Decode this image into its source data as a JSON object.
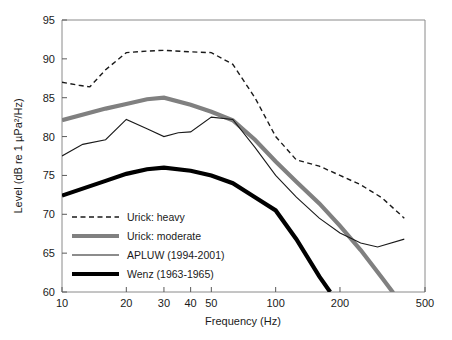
{
  "chart_data": {
    "type": "line",
    "title": "",
    "xlabel": "Frequency (Hz)",
    "ylabel": "Level (dB re 1 µPa²/Hz)",
    "xscale": "log",
    "xlim": [
      10,
      500
    ],
    "ylim": [
      60,
      95
    ],
    "grid": false,
    "legend_position": "lower left (inside axes)",
    "xticks": [
      10,
      20,
      30,
      40,
      50,
      100,
      200,
      500
    ],
    "xticklabels": [
      "10",
      "20",
      "30",
      "40",
      "50",
      "100",
      "200",
      "500"
    ],
    "yticks": [
      60,
      65,
      70,
      75,
      80,
      85,
      90,
      95
    ],
    "yticklabels": [
      "60",
      "65",
      "70",
      "75",
      "80",
      "85",
      "90",
      "95"
    ],
    "series": [
      {
        "name": "Urick: heavy",
        "style": "dashed",
        "color": "#1a1a1a",
        "width": 1.4,
        "x": [
          10,
          12,
          13.5,
          16,
          20,
          25,
          30,
          40,
          50,
          63,
          80,
          100,
          125,
          160,
          200,
          250,
          315,
          400
        ],
        "y": [
          87.0,
          86.6,
          86.4,
          88.6,
          90.8,
          91.0,
          91.1,
          90.9,
          90.8,
          89.3,
          85.0,
          80.0,
          77.0,
          76.2,
          75.0,
          73.8,
          72.1,
          69.5
        ]
      },
      {
        "name": "Urick: moderate",
        "style": "solid",
        "color": "#808080",
        "width": 4.2,
        "x": [
          10,
          16,
          20,
          25,
          30,
          40,
          50,
          63,
          80,
          100,
          125,
          160,
          200,
          250,
          315,
          355
        ],
        "y": [
          82.1,
          83.6,
          84.2,
          84.8,
          85.0,
          84.1,
          83.2,
          82.1,
          79.6,
          76.8,
          74.2,
          71.4,
          68.5,
          65.4,
          61.8,
          59.9
        ]
      },
      {
        "name": "APLUW (1994-2001)",
        "style": "solid",
        "color": "#1a1a1a",
        "width": 1.1,
        "x": [
          10,
          12.5,
          16,
          20,
          25,
          30,
          35,
          40,
          50,
          63,
          80,
          100,
          125,
          160,
          200,
          250,
          300,
          400
        ],
        "y": [
          77.5,
          79.0,
          79.6,
          82.2,
          81.0,
          80.0,
          80.5,
          80.6,
          82.5,
          82.2,
          78.6,
          75.0,
          72.2,
          69.5,
          67.6,
          66.3,
          65.8,
          66.8
        ]
      },
      {
        "name": "Wenz (1963-1965)",
        "style": "solid",
        "color": "#000000",
        "width": 4.2,
        "x": [
          10,
          16,
          20,
          25,
          30,
          40,
          50,
          63,
          80,
          100,
          125,
          160,
          180
        ],
        "y": [
          72.4,
          74.3,
          75.2,
          75.8,
          76.0,
          75.6,
          75.0,
          74.0,
          72.2,
          70.5,
          66.8,
          62.0,
          60.0
        ]
      }
    ]
  },
  "legend": {
    "items": [
      {
        "label": "Urick: heavy",
        "style": "dashed",
        "color": "#1a1a1a",
        "width": 1.4
      },
      {
        "label": "Urick: moderate",
        "style": "solid",
        "color": "#808080",
        "width": 4.2
      },
      {
        "label": "APLUW (1994-2001)",
        "style": "solid",
        "color": "#1a1a1a",
        "width": 1.1
      },
      {
        "label": "Wenz (1963-1965)",
        "style": "solid",
        "color": "#000000",
        "width": 4.2
      }
    ]
  },
  "axes": {
    "x_title": "Frequency (Hz)",
    "y_title": "Level (dB re 1 µPa²/Hz)",
    "x_labels": [
      "10",
      "20",
      "30",
      "40",
      "50",
      "100",
      "200",
      "500"
    ],
    "y_labels": [
      "60",
      "65",
      "70",
      "75",
      "80",
      "85",
      "90",
      "95"
    ]
  }
}
